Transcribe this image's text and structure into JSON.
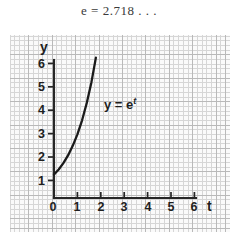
{
  "title": "e = 2.718 . . .",
  "chart_data": {
    "type": "line",
    "title": "e = 2.718 . . .",
    "annotations": [
      "y = e^t"
    ],
    "curve_label_base": "y = e",
    "curve_label_exponent": "t",
    "xlabel": "t",
    "ylabel": "y",
    "xlim": [
      0,
      6.6
    ],
    "ylim": [
      0,
      6.4
    ],
    "grid": "graph-paper",
    "legend": "none",
    "x_ticks": [
      "1",
      "2",
      "3",
      "4",
      "5",
      "6"
    ],
    "x_tick_values": [
      1,
      2,
      3,
      4,
      5,
      6
    ],
    "y_ticks": [
      "1",
      "2",
      "3",
      "4",
      "5",
      "6"
    ],
    "y_tick_values": [
      1,
      2,
      3,
      4,
      5,
      6
    ],
    "origin_label": "0",
    "series": [
      {
        "name": "y = e^t",
        "expression": "exp(t)",
        "x": [
          0.0,
          0.2,
          0.4,
          0.6,
          0.8,
          1.0,
          1.2,
          1.4,
          1.6,
          1.79
        ],
        "y": [
          1.0,
          1.22,
          1.49,
          1.82,
          2.23,
          2.72,
          3.32,
          4.06,
          4.95,
          6.0
        ],
        "color": "#1a1a1a"
      }
    ],
    "colors": {
      "curve": "#1a1a1a",
      "axis": "#262626",
      "grid_minor": "#d6d6d6",
      "grid_major": "#b9b9b9",
      "paper_background": "#fafafa",
      "page_background": "#ffffff",
      "text": "#1f1f1f",
      "title_text": "#3a3a3a"
    }
  }
}
